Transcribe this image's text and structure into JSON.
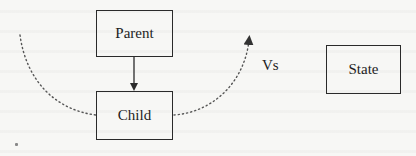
{
  "diagram": {
    "nodes": [
      {
        "id": "parent",
        "label": "Parent"
      },
      {
        "id": "child",
        "label": "Child"
      },
      {
        "id": "state",
        "label": "State"
      }
    ],
    "separator_label": "Vs",
    "edges": [
      {
        "from": "parent",
        "to": "child",
        "style": "solid",
        "arrow": "end"
      },
      {
        "from": "left-origin",
        "via": "child",
        "to": "upper-right",
        "style": "dotted-arc",
        "arrow": "end"
      }
    ],
    "colors": {
      "stroke": "#2a2a2a",
      "text": "#1e1e1e",
      "dotted": "#555555",
      "background": "#f7f7f5"
    }
  }
}
